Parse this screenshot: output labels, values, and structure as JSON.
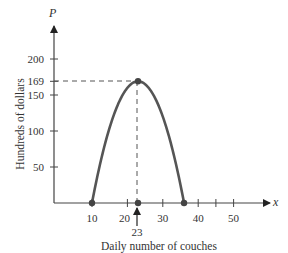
{
  "chart_data": {
    "type": "line",
    "title": "",
    "xlabel": "Daily number of couches",
    "ylabel": "Hundreds of dollars",
    "x_axis_symbol": "x",
    "y_axis_symbol": "P",
    "function": "P(x) = -x^2 + 46x - 360",
    "x_ticks": [
      10,
      20,
      30,
      40,
      50
    ],
    "x_minor_ticks": [
      45
    ],
    "y_ticks": [
      50,
      100,
      150,
      169,
      200
    ],
    "xlim": [
      0,
      60
    ],
    "ylim": [
      0,
      240
    ],
    "grid": false,
    "series": [
      {
        "name": "Profit",
        "x": [
          10,
          12,
          14,
          16,
          18,
          20,
          22,
          23,
          24,
          26,
          28,
          30,
          32,
          34,
          36
        ],
        "values": [
          0,
          48,
          88,
          120,
          144,
          160,
          168,
          169,
          168,
          160,
          144,
          120,
          88,
          48,
          0
        ]
      }
    ],
    "marked_points": [
      {
        "x": 10,
        "y": 0
      },
      {
        "x": 23,
        "y": 0
      },
      {
        "x": 23,
        "y": 169
      },
      {
        "x": 36,
        "y": 0
      }
    ],
    "annotations": [
      {
        "type": "dashed-guide",
        "from": [
          0,
          169
        ],
        "to": [
          23,
          169
        ]
      },
      {
        "type": "dashed-guide",
        "from": [
          23,
          169
        ],
        "to": [
          23,
          0
        ]
      },
      {
        "type": "arrow-label",
        "x": 23,
        "text": "23"
      }
    ]
  },
  "labels": {
    "x_symbol": "x",
    "y_symbol": "P",
    "xlabel": "Daily number of couches",
    "ylabel": "Hundreds of dollars",
    "vertex_x": "23",
    "xticks": [
      "10",
      "20",
      "30",
      "40",
      "50"
    ],
    "yticks": [
      "50",
      "100",
      "150",
      "169",
      "200"
    ]
  },
  "colors": {
    "curve": "#555555",
    "axis": "#444444",
    "text": "#333333"
  }
}
